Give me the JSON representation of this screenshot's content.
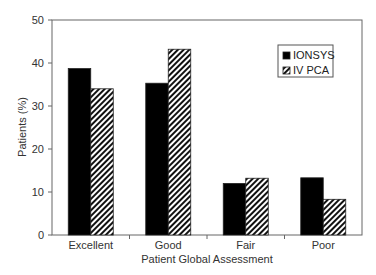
{
  "chart_data": {
    "type": "bar",
    "title": "",
    "xlabel": "Patient Global Assessment",
    "ylabel": "Patients (%)",
    "ylim": [
      0,
      50
    ],
    "yticks": [
      0,
      10,
      20,
      30,
      40,
      50
    ],
    "grid": false,
    "legend_position": "upper right",
    "categories": [
      "Excellent",
      "Good",
      "Fair",
      "Poor"
    ],
    "series": [
      {
        "name": "IONSYS",
        "pattern": "solid",
        "color": "#000000",
        "values": [
          38.7,
          35.3,
          12.0,
          13.3
        ]
      },
      {
        "name": "IV PCA",
        "pattern": "diagonal-hatch",
        "color": "#000000",
        "values": [
          34.0,
          43.2,
          13.2,
          8.3
        ]
      }
    ]
  }
}
